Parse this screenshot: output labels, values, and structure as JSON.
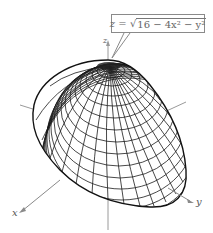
{
  "figure": {
    "type": "3d-wireframe-surface",
    "equation": {
      "lhs": "z",
      "eq": "=",
      "sqrt_symbol": "√",
      "radicand": "16 − 4x² − y²"
    },
    "axes": {
      "x_label": "x",
      "y_label": "y",
      "z_label": "z"
    },
    "colors": {
      "mesh": "#1a1a1a",
      "axes": "#9a9a9a",
      "callout_border": "#8a8a8a"
    }
  }
}
